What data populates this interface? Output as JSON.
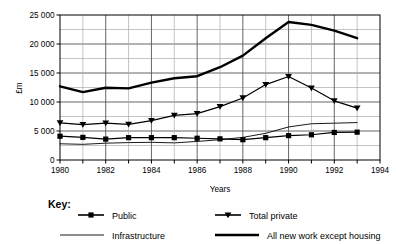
{
  "chart_data": {
    "type": "line",
    "title": "",
    "xlabel": "Years",
    "ylabel": "£m",
    "xlim": [
      1980,
      1994
    ],
    "ylim": [
      0,
      25000
    ],
    "x": [
      1980,
      1981,
      1982,
      1983,
      1984,
      1985,
      1986,
      1987,
      1988,
      1989,
      1990,
      1991,
      1992,
      1993
    ],
    "xticks": [
      1980,
      1981,
      1982,
      1983,
      1984,
      1985,
      1986,
      1987,
      1988,
      1989,
      1990,
      1991,
      1992,
      1993,
      1994
    ],
    "xtick_labels": [
      "1980",
      "",
      "1982",
      "",
      "1984",
      "",
      "1986",
      "",
      "1988",
      "",
      "1990",
      "",
      "1992",
      "",
      "1994"
    ],
    "yticks": [
      0,
      5000,
      10000,
      15000,
      20000,
      25000
    ],
    "ytick_labels": [
      "0",
      "5 000",
      "10 000",
      "15 000",
      "20 000",
      "25 000"
    ],
    "y_minor_step": 2500,
    "grid": true,
    "legend_position": "below",
    "series": [
      {
        "name": "Public",
        "marker": "square",
        "line_width": 1.2,
        "color": "#000000",
        "values": [
          4100,
          3900,
          3600,
          3850,
          3850,
          3850,
          3750,
          3650,
          3500,
          3850,
          4200,
          4350,
          4750,
          4800
        ]
      },
      {
        "name": "Total private",
        "marker": "triangle-down",
        "line_width": 1.2,
        "color": "#000000",
        "values": [
          6400,
          6100,
          6350,
          6150,
          6800,
          7700,
          8000,
          9200,
          10700,
          13000,
          14400,
          12400,
          10200,
          8950
        ]
      },
      {
        "name": "Infrastructure",
        "marker": "none",
        "line_width": 0.9,
        "color": "#000000",
        "values": [
          2800,
          2700,
          2900,
          3000,
          3050,
          2950,
          3200,
          3500,
          3900,
          4600,
          5700,
          6250,
          6350,
          6450
        ]
      },
      {
        "name": "All new work except housing",
        "marker": "none",
        "line_width": 2.4,
        "color": "#000000",
        "values": [
          12700,
          11700,
          12450,
          12350,
          13350,
          14100,
          14450,
          16000,
          18000,
          21000,
          23800,
          23300,
          22300,
          21000
        ]
      }
    ]
  },
  "key": {
    "title": "Key:",
    "entries": [
      {
        "label": "Public",
        "marker": "square",
        "line_width": 1.6
      },
      {
        "label": "Total private",
        "marker": "triangle-down",
        "line_width": 1.6
      },
      {
        "label": "Infrastructure",
        "marker": "none",
        "line_width": 0.9
      },
      {
        "label": "All new work except housing",
        "marker": "none",
        "line_width": 2.4
      }
    ]
  },
  "colors": {
    "ink": "#000000",
    "grid_major": "#555555",
    "grid_minor": "#aaaaaa",
    "background": "#ffffff"
  }
}
